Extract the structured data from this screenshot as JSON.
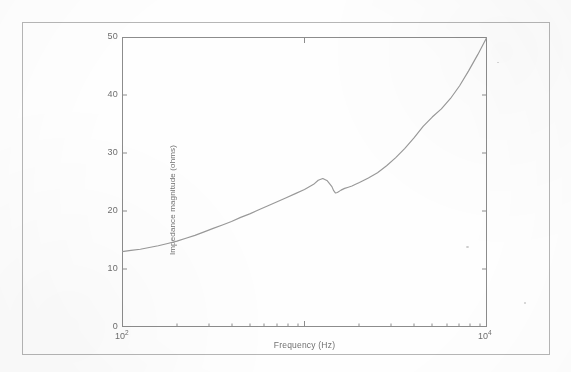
{
  "figure": {
    "kind": "scanned-figure",
    "page_background": "#fefefe",
    "frame_color": "#b9b9b9",
    "axis_color": "#8a8a8a",
    "curve_color": "#9a9a9a",
    "tick_label_color": "#6e6e6e"
  },
  "chart_data": {
    "type": "line",
    "title": "",
    "subtitle": "",
    "xlabel": "Frequency (Hz)",
    "ylabel": "Impedance magnitude (ohms)",
    "xscale": "log",
    "yscale": "linear",
    "xlim": [
      100,
      10000
    ],
    "ylim": [
      0,
      50
    ],
    "grid": false,
    "legend": null,
    "legend_position": "none",
    "xtick_labels": [
      "10",
      "10"
    ],
    "xtick_exponents": [
      "2",
      "4"
    ],
    "xtick_values": [
      100,
      10000
    ],
    "ytick_labels": [
      "0",
      "10",
      "20",
      "30",
      "40",
      "50"
    ],
    "ytick_values": [
      0,
      10,
      20,
      30,
      40,
      50
    ],
    "annotations": [],
    "series": [
      {
        "name": "Impedance magnitude",
        "color": "#9a9a9a",
        "x": [
          100,
          112,
          126,
          141,
          158,
          178,
          200,
          224,
          251,
          282,
          316,
          355,
          398,
          447,
          501,
          562,
          631,
          708,
          794,
          891,
          1000,
          1122,
          1189,
          1259,
          1334,
          1413,
          1445,
          1479,
          1514,
          1585,
          1660,
          1738,
          1820,
          1905,
          2000,
          2239,
          2512,
          2818,
          3162,
          3548,
          3981,
          4467,
          5012,
          5623,
          6310,
          7079,
          7943,
          8913,
          10000
        ],
        "y": [
          13.0,
          13.2,
          13.4,
          13.7,
          14.0,
          14.4,
          14.8,
          15.3,
          15.8,
          16.4,
          17.0,
          17.6,
          18.2,
          18.9,
          19.5,
          20.2,
          20.9,
          21.6,
          22.3,
          23.0,
          23.7,
          24.6,
          25.3,
          25.6,
          25.2,
          24.2,
          23.5,
          23.1,
          23.2,
          23.6,
          23.9,
          24.1,
          24.3,
          24.6,
          24.9,
          25.7,
          26.6,
          27.8,
          29.2,
          30.8,
          32.6,
          34.6,
          36.2,
          37.6,
          39.4,
          41.6,
          44.2,
          47.0,
          50.0
        ]
      }
    ]
  }
}
